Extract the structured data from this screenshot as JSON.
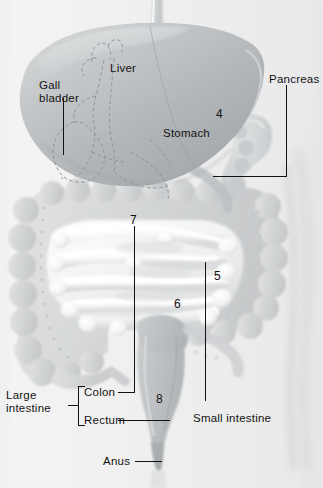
{
  "figure": {
    "background_color": "#f1f1f1",
    "ink_color": "#121212"
  },
  "labels": [
    {
      "id": "liver",
      "text": "Liver",
      "x": 110,
      "y": 62,
      "name": "label-liver"
    },
    {
      "id": "gall_bladder",
      "text": "Gall\nbladder",
      "x": 39,
      "y": 79,
      "name": "label-gall-bladder"
    },
    {
      "id": "pancreas",
      "text": "Pancreas",
      "x": 269,
      "y": 73,
      "name": "label-pancreas"
    },
    {
      "id": "stomach",
      "text": "Stomach",
      "x": 163,
      "y": 127,
      "name": "label-stomach"
    },
    {
      "id": "large_intestine",
      "text": "Large\nintestine",
      "x": 6,
      "y": 389,
      "name": "label-large-intestine"
    },
    {
      "id": "colon",
      "text": "Colon",
      "x": 84,
      "y": 386,
      "name": "label-colon"
    },
    {
      "id": "rectum",
      "text": "Rectum",
      "x": 84,
      "y": 414,
      "name": "label-rectum"
    },
    {
      "id": "small_intestine",
      "text": "Small intestine",
      "x": 193,
      "y": 412,
      "name": "label-small-intestine"
    },
    {
      "id": "anus",
      "text": "Anus",
      "x": 103,
      "y": 455,
      "name": "label-anus"
    }
  ],
  "numbers": [
    {
      "id": "n4",
      "text": "4",
      "x": 216,
      "y": 108,
      "name": "callout-number-4"
    },
    {
      "id": "n7",
      "text": "7",
      "x": 130,
      "y": 214,
      "name": "callout-number-7"
    },
    {
      "id": "n5",
      "text": "5",
      "x": 214,
      "y": 270,
      "name": "callout-number-5"
    },
    {
      "id": "n6",
      "text": "6",
      "x": 174,
      "y": 298,
      "name": "callout-number-6"
    },
    {
      "id": "n8",
      "text": "8",
      "x": 156,
      "y": 393,
      "name": "callout-number-8"
    }
  ],
  "organs": [
    {
      "id": "esophagus",
      "label": "esophagus"
    },
    {
      "id": "liver",
      "label": "liver"
    },
    {
      "id": "gall_bladder",
      "label": "gall bladder"
    },
    {
      "id": "biliary_tree",
      "label": "bile ducts"
    },
    {
      "id": "stomach",
      "label": "stomach"
    },
    {
      "id": "pancreas",
      "label": "pancreas"
    },
    {
      "id": "large_intestine",
      "label": "large intestine / colon"
    },
    {
      "id": "small_intestine",
      "label": "small intestine"
    },
    {
      "id": "rectum",
      "label": "rectum"
    },
    {
      "id": "anus",
      "label": "anus"
    },
    {
      "id": "body_outline",
      "label": "torso outline"
    }
  ],
  "leaders": {
    "gall_bladder": "vertical line down from label to gall bladder",
    "pancreas": "elbow line down then left to pancreas head",
    "colon": "long vertical line up from colon label to number 7",
    "rectum": "horizontal line right to rectum",
    "small_intestine": "vertical line up from label to number 5",
    "anus": "horizontal line right to anus",
    "large_intestine": "bracket spanning colon and rectum labels"
  }
}
